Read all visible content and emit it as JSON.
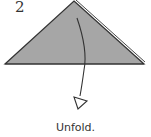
{
  "step": {
    "number": "2",
    "caption": "Unfold."
  },
  "diagram": {
    "shape": "triangle",
    "fill_color": "#a6a6a6",
    "stroke_color": "#333333",
    "arrow": "unfold-arrow-down",
    "arrow_style": "hollow-head"
  }
}
